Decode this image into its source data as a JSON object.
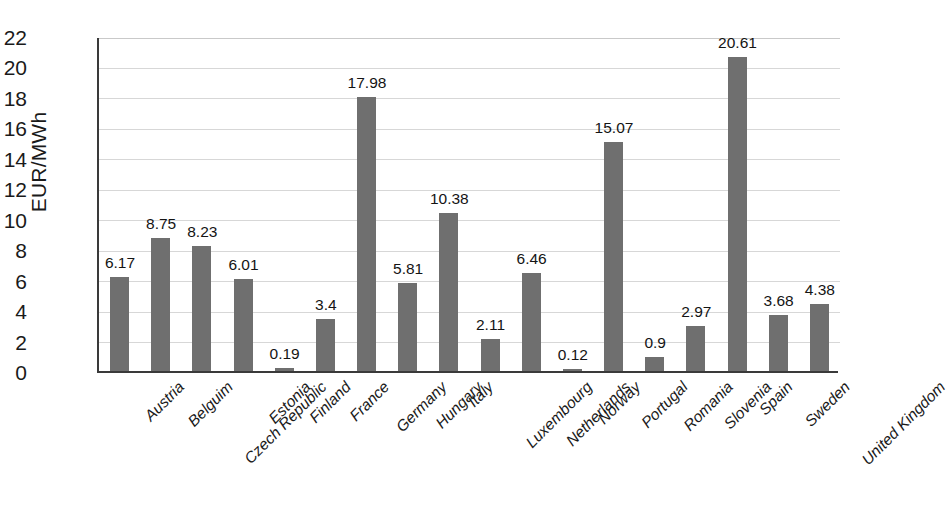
{
  "chart_data": {
    "type": "bar",
    "title": "",
    "xlabel": "",
    "ylabel": "EUR/MWh",
    "ylim": [
      0,
      22
    ],
    "ytick_step": 2,
    "yticks": [
      "22",
      "20",
      "18",
      "16",
      "14",
      "12",
      "10",
      "8",
      "6",
      "4",
      "2",
      "0"
    ],
    "grid": true,
    "legend": "none",
    "bar_color": "#6f6f6f",
    "categories": [
      "Austria",
      "Belguim",
      "Czech Republic",
      "Estonia",
      "Finland",
      "France",
      "Germany",
      "Hungary",
      "Italy",
      "Luxembourg",
      "Netherlands",
      "Norway",
      "Portugal",
      "Romania",
      "Slovenia",
      "Spain",
      "Sweden",
      "United Kingdom"
    ],
    "values": [
      6.17,
      8.75,
      8.23,
      6.01,
      0.19,
      3.4,
      17.98,
      5.81,
      10.38,
      2.11,
      6.46,
      0.12,
      15.07,
      0.9,
      2.97,
      20.61,
      3.68,
      4.38
    ],
    "value_labels": [
      "6.17",
      "8.75",
      "8.23",
      "6.01",
      "0.19",
      "3.4",
      "17.98",
      "5.81",
      "10.38",
      "2.11",
      "6.46",
      "0.12",
      "15.07",
      "0.9",
      "2.97",
      "20.61",
      "3.68",
      "4.38"
    ]
  }
}
